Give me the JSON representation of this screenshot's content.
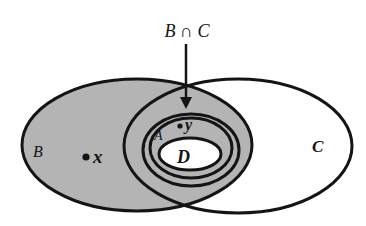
{
  "diagram": {
    "type": "venn",
    "title_label": "B ∩ C",
    "sets": [
      {
        "id": "B",
        "label": "B",
        "shaded": true
      },
      {
        "id": "C",
        "label": "C",
        "shaded": false
      },
      {
        "id": "A",
        "label": "A",
        "shaded": true,
        "subset_of": [
          "B",
          "C"
        ]
      },
      {
        "id": "D",
        "label": "D",
        "shaded": false,
        "subset_of": [
          "A"
        ]
      }
    ],
    "points": [
      {
        "id": "x",
        "label": "x",
        "in": "B"
      },
      {
        "id": "y",
        "label": "y",
        "in": "A"
      }
    ],
    "arrow": {
      "from": "B ∩ C",
      "points_to": "intersection of B and C"
    },
    "colors": {
      "shade": "#b4b4b4",
      "stroke": "#141414",
      "background": "#ffffff"
    }
  }
}
